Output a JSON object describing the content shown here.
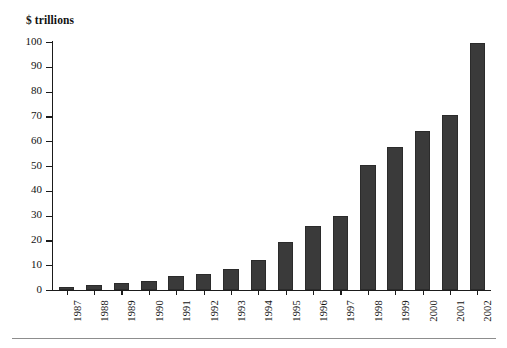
{
  "chart_data": {
    "type": "bar",
    "title": "$ trillions",
    "subtitle": "",
    "xlabel": "",
    "ylabel": "$ trillions",
    "ylim": [
      0,
      100
    ],
    "yticks": [
      0,
      10,
      20,
      30,
      40,
      50,
      60,
      70,
      80,
      90,
      100
    ],
    "ytick_labels": [
      "0",
      "10",
      "20",
      "30",
      "40",
      "50",
      "60",
      "70",
      "80",
      "90",
      "100"
    ],
    "grid": false,
    "legend": false,
    "legend_position": "none",
    "bar_color": "#3a3a3a",
    "axis_color": "#1b1b1b",
    "categories": [
      "1987",
      "1988",
      "1989",
      "1990",
      "1991",
      "1992",
      "1993",
      "1994",
      "1995",
      "1996",
      "1997",
      "1998",
      "1999",
      "2000",
      "2001",
      "2002"
    ],
    "values": [
      1.3,
      2.0,
      2.8,
      3.8,
      5.5,
      6.5,
      8.5,
      12.0,
      19.5,
      26.0,
      30.0,
      50.5,
      57.5,
      64.0,
      70.5,
      99.5
    ],
    "series": [
      {
        "name": "$ trillions",
        "values": [
          1.3,
          2.0,
          2.8,
          3.8,
          5.5,
          6.5,
          8.5,
          12.0,
          19.5,
          26.0,
          30.0,
          50.5,
          57.5,
          64.0,
          70.5,
          99.5
        ]
      }
    ],
    "annotations": []
  }
}
